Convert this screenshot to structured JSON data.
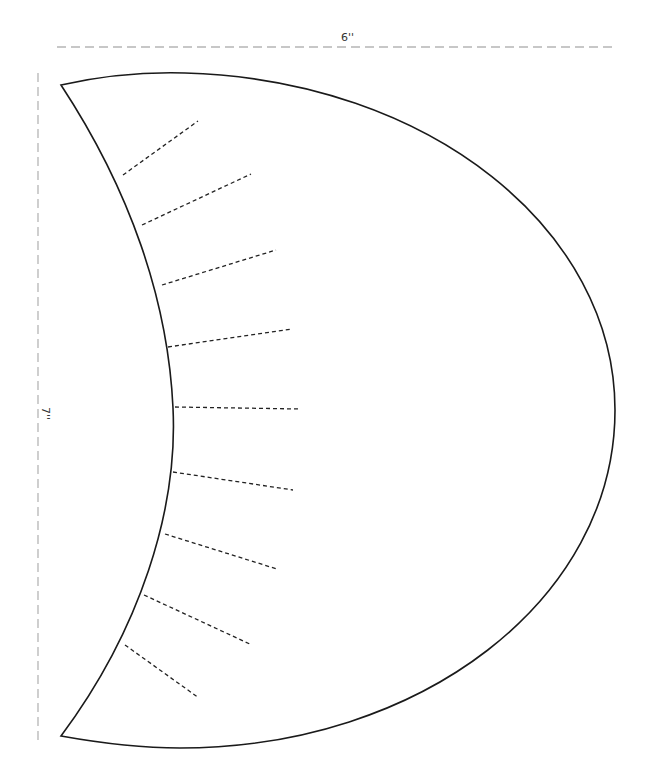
{
  "diagram": {
    "type": "sewing-pattern-piece",
    "shape": "crescent",
    "dimensions": {
      "width": {
        "label": "6''",
        "value": 6,
        "unit": "inch"
      },
      "height": {
        "label": "7''",
        "value": 7,
        "unit": "inch"
      }
    },
    "slash_lines": {
      "count": 9,
      "style": "dashed"
    },
    "colors": {
      "outline": "#1a1a1a",
      "slash_lines": "#222222",
      "dimension_guides": "#b5b5b5",
      "background": "#ffffff"
    }
  }
}
